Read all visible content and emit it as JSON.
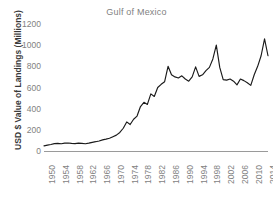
{
  "chart_data": {
    "type": "line",
    "title": "Gulf of Mexico",
    "xlabel": "",
    "ylabel": "USD $ Value of Landings (Millions)",
    "ylim": [
      0,
      1200
    ],
    "xlim": [
      1950,
      2015
    ],
    "yticks": [
      0,
      200,
      400,
      600,
      800,
      1000,
      1200
    ],
    "xtick_labels": [
      "1950",
      "1954",
      "1958",
      "1962",
      "1966",
      "1970",
      "1974",
      "1978",
      "1982",
      "1986",
      "1990",
      "1994",
      "1998",
      "2002",
      "2006",
      "2010",
      "2014"
    ],
    "grid": false,
    "legend": false,
    "line_color": "#1a1a1a",
    "text_color": "#7f7f7f",
    "axis_color": "#9a9a9a",
    "series": [
      {
        "name": "Gulf of Mexico",
        "x": [
          1950,
          1951,
          1952,
          1953,
          1954,
          1955,
          1956,
          1957,
          1958,
          1959,
          1960,
          1961,
          1962,
          1963,
          1964,
          1965,
          1966,
          1967,
          1968,
          1969,
          1970,
          1971,
          1972,
          1973,
          1974,
          1975,
          1976,
          1977,
          1978,
          1979,
          1980,
          1981,
          1982,
          1983,
          1984,
          1985,
          1986,
          1987,
          1988,
          1989,
          1990,
          1991,
          1992,
          1993,
          1994,
          1995,
          1996,
          1997,
          1998,
          1999,
          2000,
          2001,
          2002,
          2003,
          2004,
          2005,
          2006,
          2007,
          2008,
          2009,
          2010,
          2011,
          2012,
          2013,
          2014,
          2015
        ],
        "values": [
          48,
          55,
          62,
          70,
          72,
          68,
          74,
          76,
          72,
          70,
          74,
          72,
          68,
          74,
          82,
          88,
          95,
          105,
          112,
          120,
          135,
          150,
          175,
          215,
          275,
          250,
          300,
          330,
          420,
          460,
          440,
          540,
          515,
          600,
          630,
          655,
          800,
          720,
          700,
          690,
          710,
          680,
          660,
          700,
          795,
          705,
          720,
          760,
          790,
          870,
          1000,
          790,
          675,
          670,
          680,
          660,
          625,
          680,
          665,
          645,
          620,
          720,
          800,
          900,
          1060,
          900
        ]
      }
    ]
  }
}
